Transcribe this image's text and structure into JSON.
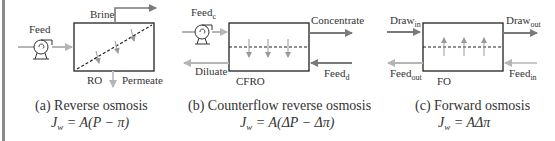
{
  "panels": [
    {
      "id": "ro",
      "caption": "(a) Reverse osmosis",
      "equation": {
        "lhs": "J",
        "lhs_sub": "w",
        "rhs": " = A(P − π)"
      },
      "module_label": "RO",
      "labels": {
        "feed": "Feed",
        "brine": "Brine",
        "permeate": "Permeate"
      }
    },
    {
      "id": "cfro",
      "caption": "(b) Counterflow reverse osmosis",
      "equation": {
        "lhs": "J",
        "lhs_sub": "w",
        "rhs": " = A(ΔP − Δπ)"
      },
      "module_label": "CFRO",
      "labels": {
        "feed_c": "Feed",
        "feed_c_sub": "c",
        "concentrate": "Concentrate",
        "diluate": "Diluate",
        "feed_d": "Feed",
        "feed_d_sub": "d"
      }
    },
    {
      "id": "fo",
      "caption": "(c) Forward osmosis",
      "equation": {
        "lhs": "J",
        "lhs_sub": "w",
        "rhs": " = AΔπ"
      },
      "module_label": "FO",
      "labels": {
        "draw_in": "Draw",
        "draw_in_sub": "in",
        "draw_out": "Draw",
        "draw_out_sub": "out",
        "feed_out": "Feed",
        "feed_out_sub": "out",
        "feed_in": "Feed",
        "feed_in_sub": "in"
      }
    }
  ],
  "colors": {
    "stroke": "#222222",
    "arrow_dark": "#7a7a7a",
    "arrow_light": "#b5b5b5",
    "text": "#333333"
  }
}
